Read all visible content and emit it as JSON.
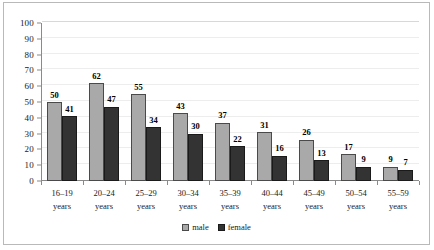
{
  "chart_data": {
    "type": "bar",
    "title": "",
    "subtitle": "",
    "xlabel": "",
    "ylabel": "",
    "ylim": [
      0,
      100
    ],
    "yticks": [
      0,
      10,
      20,
      30,
      40,
      50,
      60,
      70,
      80,
      90,
      100
    ],
    "grid": true,
    "legend_position": "bottom-center",
    "categories": [
      "16–19\nyears",
      "20–24\nyears",
      "25–29\nyears",
      "30–34\nyears",
      "35–39\nyears",
      "40–44\nyears",
      "45–49\nyears",
      "50–54\nyears",
      "55–59\nyears"
    ],
    "category_lines": [
      [
        "16–19",
        "years"
      ],
      [
        "20–24",
        "years"
      ],
      [
        "25–29",
        "years"
      ],
      [
        "30–34",
        "years"
      ],
      [
        "35–39",
        "years"
      ],
      [
        "40–44",
        "years"
      ],
      [
        "45–49",
        "years"
      ],
      [
        "50–54",
        "years"
      ],
      [
        "55–59",
        "years"
      ]
    ],
    "series": [
      {
        "name": "male",
        "color": "#a9a9a9",
        "values": [
          50,
          62,
          55,
          43,
          37,
          31,
          26,
          17,
          9
        ]
      },
      {
        "name": "female",
        "color": "#333333",
        "values": [
          41,
          47,
          34,
          30,
          22,
          16,
          13,
          9,
          7
        ]
      }
    ]
  },
  "legend": {
    "items": [
      {
        "label": "male",
        "color": "#a9a9a9"
      },
      {
        "label": "female",
        "color": "#333333"
      }
    ]
  },
  "colors": {
    "male_bar": "#a9a9a9",
    "female_bar": "#333333",
    "axis": "#8a8a8a",
    "gridline": "#ededed",
    "frame_border": "#b9b9b9",
    "text": "#1a1a1a"
  }
}
